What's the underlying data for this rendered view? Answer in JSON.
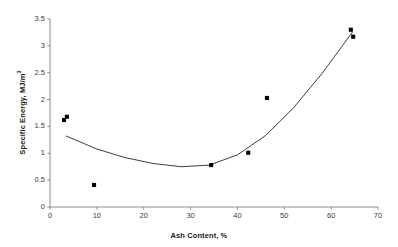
{
  "chart_data": {
    "type": "scatter",
    "title": "",
    "xlabel": "Ash Content, %",
    "ylabel": "Specific Energy, MJ/m",
    "ylabel_superscript": "3",
    "xlim": [
      0,
      70
    ],
    "ylim": [
      0,
      3.5
    ],
    "xticks": [
      "0",
      "10",
      "20",
      "30",
      "40",
      "50",
      "60",
      "70"
    ],
    "xtick_values": [
      0,
      10,
      20,
      30,
      40,
      50,
      60,
      70
    ],
    "yticks": [
      "0",
      "0.5",
      "1",
      "1.5",
      "2",
      "2.5",
      "3",
      "3.5"
    ],
    "ytick_values": [
      0,
      0.5,
      1,
      1.5,
      2,
      2.5,
      3,
      3.5
    ],
    "grid": false,
    "legend": false,
    "marker_color": "#000000",
    "marker_shape": "square",
    "axis_color": "#808080",
    "trendline_color": "#1a1a1a",
    "points": [
      {
        "x": 3.0,
        "y": 1.62
      },
      {
        "x": 3.6,
        "y": 1.68
      },
      {
        "x": 9.4,
        "y": 0.41
      },
      {
        "x": 34.4,
        "y": 0.78
      },
      {
        "x": 42.3,
        "y": 1.01
      },
      {
        "x": 46.3,
        "y": 2.03
      },
      {
        "x": 64.2,
        "y": 3.3
      },
      {
        "x": 64.7,
        "y": 3.17
      }
    ],
    "series": [
      {
        "name": "Specific Energy",
        "x": [
          3.0,
          3.6,
          9.4,
          34.4,
          42.3,
          46.3,
          64.2,
          64.7
        ],
        "values": [
          1.62,
          1.68,
          0.41,
          0.78,
          1.01,
          2.03,
          3.3,
          3.17
        ]
      }
    ],
    "trendline": {
      "type": "polynomial",
      "degree": 2,
      "x_start": 3.5,
      "x_end": 64.5,
      "sampled_x": [
        3.5,
        10,
        16,
        22,
        28,
        34,
        40,
        46,
        52,
        58,
        64.5
      ],
      "sampled_y": [
        1.32,
        1.08,
        0.92,
        0.81,
        0.75,
        0.78,
        0.97,
        1.33,
        1.85,
        2.48,
        3.25
      ]
    }
  }
}
